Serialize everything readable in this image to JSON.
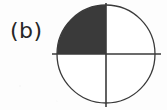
{
  "figure": {
    "panel_label": "(b)",
    "shape": "circle",
    "background_color": "#fdfdfd",
    "outline_color": "#3a3a3a",
    "divider_color": "#3a3a3a",
    "shaded_fill_color": "#3a3a3a",
    "unshaded_fill_color": "#ffffff",
    "label_color": "#262626",
    "geometry": {
      "center_x": 106,
      "center_y": 54,
      "radius": 49,
      "outline_width": 1.3,
      "divider_width": 1.6,
      "vertical_line_top_y": 3,
      "vertical_line_bottom_y": 107,
      "horizontal_line_left_x": 52,
      "horizontal_line_right_x": 161
    },
    "quadrants": [
      {
        "name": "upper-left",
        "position": "top-left",
        "shaded": true,
        "fraction": "1/4",
        "fill": "#3a3a3a"
      },
      {
        "name": "upper-right",
        "position": "top-right",
        "shaded": false,
        "fraction": "1/4",
        "fill": "#ffffff"
      },
      {
        "name": "lower-right",
        "position": "bottom-right",
        "shaded": false,
        "fraction": "1/4",
        "fill": "#ffffff"
      },
      {
        "name": "lower-left",
        "position": "bottom-left",
        "shaded": false,
        "fraction": "1/4",
        "fill": "#ffffff"
      }
    ],
    "shaded_count": 1,
    "total_parts": 4,
    "shaded_fraction": "1/4"
  }
}
